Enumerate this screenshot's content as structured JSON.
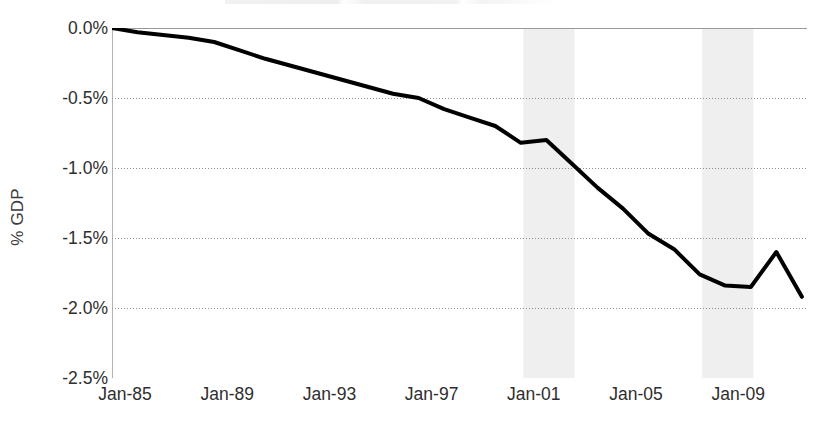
{
  "chart_data": {
    "type": "line",
    "title": "",
    "xlabel": "",
    "ylabel": "% GDP",
    "ylim": [
      -2.5,
      0.0
    ],
    "yticks": [
      "0.0%",
      "-0.5%",
      "-1.0%",
      "-1.5%",
      "-2.0%",
      "-2.5%"
    ],
    "ytick_values": [
      0.0,
      -0.5,
      -1.0,
      -1.5,
      -2.0,
      -2.5
    ],
    "xticks": [
      "Jan-85",
      "Jan-89",
      "Jan-93",
      "Jan-97",
      "Jan-01",
      "Jan-05",
      "Jan-09"
    ],
    "xtick_values": [
      1985,
      1989,
      1993,
      1997,
      2001,
      2005,
      2009
    ],
    "xlim": [
      1985,
      2012.2
    ],
    "grid": "horizontal-dotted",
    "legend": "none",
    "series": [
      {
        "name": "% GDP",
        "color": "#000000",
        "line_width": 4,
        "x": [
          1985,
          1986,
          1987,
          1988,
          1989,
          1990,
          1991,
          1992,
          1993,
          1994,
          1995,
          1996,
          1997,
          1998,
          1999,
          2000,
          2001,
          2002,
          2003,
          2004,
          2005,
          2006,
          2007,
          2008,
          2009,
          2010,
          2011,
          2012
        ],
        "values": [
          0.0,
          -0.03,
          -0.05,
          -0.07,
          -0.1,
          -0.16,
          -0.22,
          -0.27,
          -0.32,
          -0.37,
          -0.42,
          -0.47,
          -0.5,
          -0.58,
          -0.64,
          -0.7,
          -0.82,
          -0.8,
          -0.97,
          -1.14,
          -1.29,
          -1.47,
          -1.58,
          -1.76,
          -1.84,
          -1.85,
          -1.6,
          -1.92
        ]
      }
    ],
    "shaded_regions": [
      {
        "name": "recession-band-2001",
        "x0": 2001.1,
        "x1": 2003.1,
        "color": "#efefef"
      },
      {
        "name": "recession-band-2008",
        "x0": 2008.1,
        "x1": 2010.1,
        "color": "#efefef"
      }
    ]
  }
}
